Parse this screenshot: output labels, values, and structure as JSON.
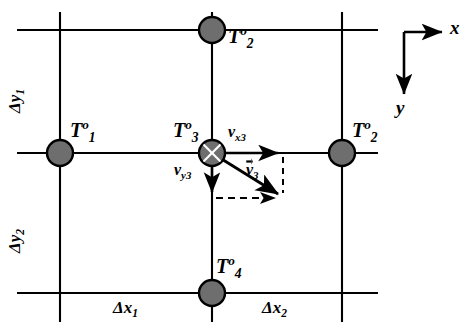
{
  "figure": {
    "type": "grid-stencil-diagram",
    "background_color": "#ffffff",
    "line_color": "#000000",
    "node_fill_color": "#6e6e6e",
    "node_stroke_color": "#000000"
  },
  "nodes": [
    {
      "id": "node-top",
      "label_T": "T",
      "superscript": "o",
      "subscript": "2",
      "cx": 212,
      "cy": 30,
      "r": 13,
      "crossed": false
    },
    {
      "id": "node-left",
      "label_T": "T",
      "superscript": "o",
      "subscript": "1",
      "cx": 60,
      "cy": 153,
      "r": 13,
      "crossed": false
    },
    {
      "id": "node-center",
      "label_T": "T",
      "superscript": "o",
      "subscript": "3",
      "cx": 212,
      "cy": 153,
      "r": 13,
      "crossed": true
    },
    {
      "id": "node-right",
      "label_T": "T",
      "superscript": "o",
      "subscript": "2",
      "cx": 342,
      "cy": 153,
      "r": 13,
      "crossed": false
    },
    {
      "id": "node-bottom",
      "label_T": "T",
      "superscript": "o",
      "subscript": "4",
      "cx": 212,
      "cy": 293,
      "r": 13,
      "crossed": false
    }
  ],
  "node_labels": [
    {
      "name": "node-label-top",
      "text_main": "T",
      "sup": "o",
      "sub": "2",
      "x": 228,
      "y": 26
    },
    {
      "name": "node-label-left",
      "text_main": "T",
      "sup": "o",
      "sub": "1",
      "x": 70,
      "y": 118
    },
    {
      "name": "node-label-center",
      "text_main": "T",
      "sup": "o",
      "sub": "3",
      "x": 176,
      "y": 118
    },
    {
      "name": "node-label-right",
      "text_main": "T",
      "sup": "o",
      "sub": "2",
      "x": 352,
      "y": 118
    },
    {
      "name": "node-label-bottom",
      "text_main": "T",
      "sup": "o",
      "sub": "4",
      "x": 219,
      "y": 254
    }
  ],
  "grid": {
    "horizontal_lines": [
      {
        "name": "grid-line-h-top",
        "x1": 17,
        "y1": 30,
        "x2": 378,
        "y2": 30
      },
      {
        "name": "grid-line-h-middle",
        "x1": 17,
        "y1": 153,
        "x2": 378,
        "y2": 153
      },
      {
        "name": "grid-line-h-bottom",
        "x1": 17,
        "y1": 293,
        "x2": 378,
        "y2": 293
      }
    ],
    "vertical_lines": [
      {
        "name": "grid-line-v-left",
        "x1": 60,
        "y1": 12,
        "x2": 60,
        "y2": 322
      },
      {
        "name": "grid-line-v-center",
        "x1": 212,
        "y1": 12,
        "x2": 212,
        "y2": 322
      },
      {
        "name": "grid-line-v-right",
        "x1": 342,
        "y1": 12,
        "x2": 342,
        "y2": 322
      }
    ]
  },
  "spacing_labels": [
    {
      "name": "spacing-label-dx1",
      "symbol": "Δ",
      "var": "x",
      "sub": "1",
      "x": 113,
      "y": 300,
      "rotated": false
    },
    {
      "name": "spacing-label-dx2",
      "symbol": "Δ",
      "var": "x",
      "sub": "2",
      "x": 262,
      "y": 300,
      "rotated": false
    },
    {
      "name": "spacing-label-dy1",
      "symbol": "Δ",
      "var": "y",
      "sub": "1",
      "x": 6,
      "y": 110,
      "rotated": true
    },
    {
      "name": "spacing-label-dy2",
      "symbol": "Δ",
      "var": "y",
      "sub": "2",
      "x": 6,
      "y": 250,
      "rotated": true
    }
  ],
  "velocity": {
    "origin": {
      "x": 212,
      "y": 153
    },
    "vectors": [
      {
        "name": "velocity-vector-x",
        "label_main": "v",
        "label_sub": "x3",
        "overbar_arrow": false,
        "x1": 212,
        "y1": 153,
        "x2": 283,
        "y2": 153,
        "label_x": 228,
        "label_y": 126
      },
      {
        "name": "velocity-vector-y",
        "label_main": "v",
        "label_sub": "y3",
        "overbar_arrow": false,
        "x1": 212,
        "y1": 153,
        "x2": 212,
        "y2": 198,
        "label_x": 176,
        "label_y": 163
      },
      {
        "name": "velocity-vector-resultant",
        "label_main": "v",
        "label_sub": "3",
        "overbar_arrow": true,
        "x1": 212,
        "y1": 153,
        "x2": 283,
        "y2": 198,
        "label_x": 246,
        "label_y": 163
      }
    ],
    "dashed_guides": [
      {
        "name": "dashed-guide-horizontal",
        "x1": 215,
        "y1": 198,
        "x2": 281,
        "y2": 198
      },
      {
        "name": "dashed-guide-vertical",
        "x1": 283,
        "y1": 156,
        "x2": 283,
        "y2": 196
      }
    ]
  },
  "axes": {
    "name": "coordinate-axes",
    "corner": {
      "x": 404,
      "y": 32
    },
    "x_axis": {
      "name": "axis-arrow-x",
      "x1": 404,
      "y1": 32,
      "x2": 448,
      "y2": 32,
      "label": "x",
      "label_x": 452,
      "label_y": 20
    },
    "y_axis": {
      "name": "axis-arrow-y",
      "x1": 404,
      "y1": 32,
      "x2": 404,
      "y2": 100,
      "label": "y",
      "label_x": 396,
      "label_y": 102
    }
  }
}
